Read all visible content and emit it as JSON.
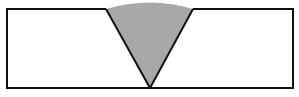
{
  "diagram": {
    "type": "weld-cross-section",
    "colors": {
      "background": "#ffffff",
      "outline": "#111111",
      "weld_fill": "#a8a8a8"
    },
    "plate": {
      "left": 7,
      "top": 9,
      "right": 293,
      "bottom": 88
    },
    "groove": {
      "top_left_x": 106,
      "top_right_x": 193,
      "root_x": 150,
      "root_y": 88,
      "cap_peak_y": 2
    }
  }
}
